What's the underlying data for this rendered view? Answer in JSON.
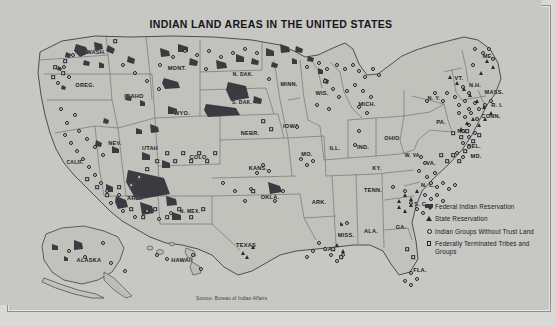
{
  "map": {
    "title": "INDIAN LAND AREAS IN THE UNITED STATES",
    "source": "Source: Bureau of Indian Affairs",
    "colors": {
      "plate_background": "#c7c7c4",
      "land_fill": "#c2c2bd",
      "reservation_fill": "#3a3a40",
      "state_border": "#55555c",
      "outer_background": "#d9d9d7",
      "text": "#17171c"
    },
    "legend": {
      "items": [
        {
          "symbol": "federal-reservation-swatch",
          "label": "Federal Indian Reservation"
        },
        {
          "symbol": "state-reservation-triangle",
          "label": "State Reservation"
        },
        {
          "symbol": "indian-groups-circle",
          "label": "Indian Groups Without Trust Land"
        },
        {
          "symbol": "terminated-tribes-square",
          "label": "Federally Terminated Tribes and Groups"
        }
      ]
    },
    "insets": [
      {
        "name": "ALASKA"
      },
      {
        "name": "HAWAII"
      }
    ],
    "state_labels": [
      {
        "name": "WASH.",
        "x": 89,
        "y": 47
      },
      {
        "name": "OREG.",
        "x": 78,
        "y": 80
      },
      {
        "name": "IDAHO",
        "x": 127,
        "y": 91
      },
      {
        "name": "MONT.",
        "x": 170,
        "y": 63
      },
      {
        "name": "N. DAK.",
        "x": 236,
        "y": 69
      },
      {
        "name": "MINN.",
        "x": 282,
        "y": 79
      },
      {
        "name": "S. DAK.",
        "x": 235,
        "y": 97
      },
      {
        "name": "WYO.",
        "x": 175,
        "y": 108
      },
      {
        "name": "NEV.",
        "x": 108,
        "y": 138
      },
      {
        "name": "UTAH",
        "x": 143,
        "y": 143
      },
      {
        "name": "COLO.",
        "x": 192,
        "y": 152
      },
      {
        "name": "NEBR.",
        "x": 243,
        "y": 128
      },
      {
        "name": "IOWA",
        "x": 284,
        "y": 121
      },
      {
        "name": "WIS.",
        "x": 315,
        "y": 88
      },
      {
        "name": "MICH.",
        "x": 360,
        "y": 99
      },
      {
        "name": "ILL.",
        "x": 328,
        "y": 143
      },
      {
        "name": "IND.",
        "x": 356,
        "y": 142
      },
      {
        "name": "OHIO",
        "x": 385,
        "y": 133
      },
      {
        "name": "PA.",
        "x": 434,
        "y": 117
      },
      {
        "name": "N. Y.",
        "x": 427,
        "y": 93
      },
      {
        "name": "VT.",
        "x": 452,
        "y": 73
      },
      {
        "name": "N.H.",
        "x": 468,
        "y": 80
      },
      {
        "name": "MASS.",
        "x": 487,
        "y": 87
      },
      {
        "name": "ME.",
        "x": 481,
        "y": 51
      },
      {
        "name": "R. I.",
        "x": 490,
        "y": 100
      },
      {
        "name": "CONN.",
        "x": 484,
        "y": 111
      },
      {
        "name": "N.J.",
        "x": 456,
        "y": 126
      },
      {
        "name": "DEL.",
        "x": 467,
        "y": 141
      },
      {
        "name": "MD.",
        "x": 469,
        "y": 151
      },
      {
        "name": "W. VA.",
        "x": 406,
        "y": 150
      },
      {
        "name": "VA.",
        "x": 424,
        "y": 158
      },
      {
        "name": "KY.",
        "x": 370,
        "y": 163
      },
      {
        "name": "MO.",
        "x": 300,
        "y": 149
      },
      {
        "name": "KANS.",
        "x": 251,
        "y": 163
      },
      {
        "name": "OKLA.",
        "x": 263,
        "y": 192
      },
      {
        "name": "N. MEX.",
        "x": 183,
        "y": 206
      },
      {
        "name": "ARIZ.",
        "x": 128,
        "y": 193
      },
      {
        "name": "CALIF.",
        "x": 68,
        "y": 157
      },
      {
        "name": "TEXAS",
        "x": 239,
        "y": 240
      },
      {
        "name": "ARK.",
        "x": 312,
        "y": 197
      },
      {
        "name": "LA.",
        "x": 322,
        "y": 244
      },
      {
        "name": "MISS.",
        "x": 339,
        "y": 230
      },
      {
        "name": "TENN.",
        "x": 366,
        "y": 185
      },
      {
        "name": "ALA.",
        "x": 364,
        "y": 226
      },
      {
        "name": "GA.",
        "x": 394,
        "y": 222
      },
      {
        "name": "FLA.",
        "x": 413,
        "y": 265
      },
      {
        "name": "S. C.",
        "x": 414,
        "y": 199
      },
      {
        "name": "N. C.",
        "x": 421,
        "y": 180
      },
      {
        "name": "ALASKA",
        "x": 82,
        "y": 255
      },
      {
        "name": "HAWAII",
        "x": 175,
        "y": 255
      }
    ]
  }
}
